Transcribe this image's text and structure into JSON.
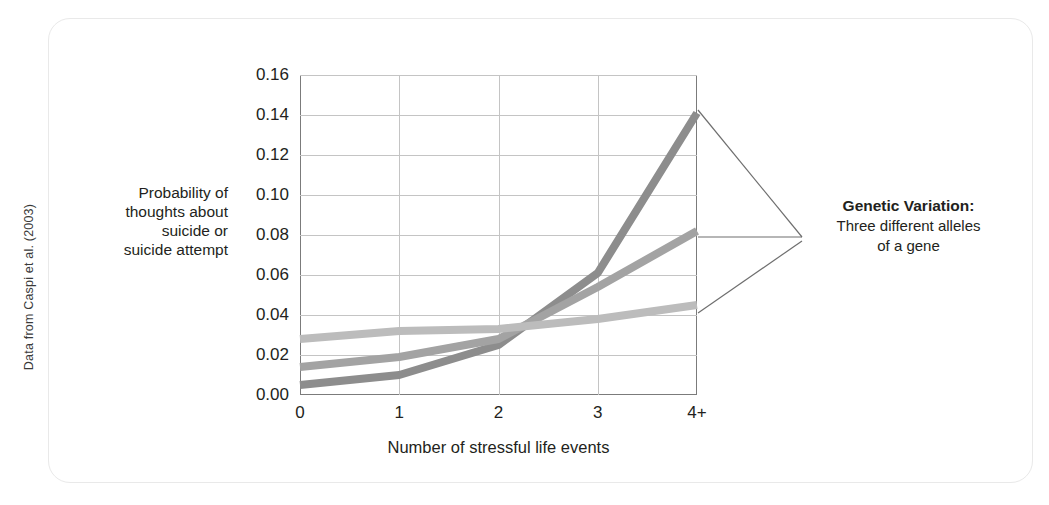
{
  "source_credit": "Data from Caspi et al. (2003)",
  "callout": {
    "title": "Genetic Variation:",
    "line1": "Three different alleles",
    "line2": "of a gene"
  },
  "chart_data": {
    "type": "line",
    "title": "",
    "xlabel": "Number of stressful life events",
    "ylabel": "Probability of thoughts about suicide or suicide attempt",
    "ylabel_lines": [
      "Probability of",
      "thoughts about",
      "suicide or",
      "suicide attempt"
    ],
    "categories": [
      "0",
      "1",
      "2",
      "3",
      "4+"
    ],
    "x": [
      0,
      1,
      2,
      3,
      4
    ],
    "xlim": [
      0,
      4
    ],
    "ylim": [
      0.0,
      0.16
    ],
    "yticks": [
      0.0,
      0.02,
      0.04,
      0.06,
      0.08,
      0.1,
      0.12,
      0.14,
      0.16
    ],
    "ytick_labels": [
      "0.00",
      "0.02",
      "0.04",
      "0.06",
      "0.08",
      "0.10",
      "0.12",
      "0.14",
      "0.16"
    ],
    "grid": true,
    "legend": "none",
    "series": [
      {
        "name": "allele-dark",
        "color": "#8d8d8d",
        "values": [
          0.005,
          0.01,
          0.025,
          0.061,
          0.141
        ]
      },
      {
        "name": "allele-medium",
        "color": "#a3a3a3",
        "values": [
          0.014,
          0.019,
          0.028,
          0.054,
          0.082
        ]
      },
      {
        "name": "allele-light",
        "color": "#bcbcbc",
        "values": [
          0.028,
          0.032,
          0.033,
          0.038,
          0.045
        ]
      }
    ]
  }
}
